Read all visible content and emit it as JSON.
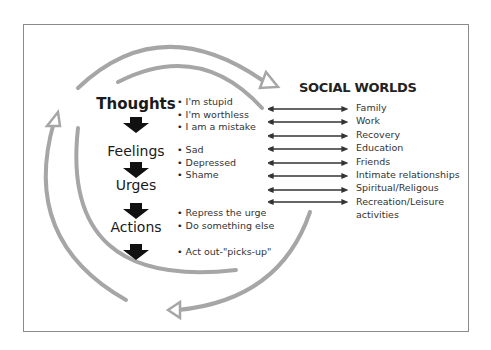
{
  "diagram": {
    "stages": [
      {
        "label": "Thoughts",
        "examples": [
          "I'm stupid",
          "I'm worthless",
          "I am a mistake"
        ]
      },
      {
        "label": "Feelings",
        "examples": [
          "Sad",
          "Depressed",
          "Shame"
        ]
      },
      {
        "label": "Urges",
        "examples": [
          "Repress the urge",
          "Do something else"
        ]
      },
      {
        "label": "Actions",
        "examples": [
          "Act out-\"picks-up\""
        ]
      }
    ],
    "social_worlds": {
      "title": "SOCIAL WORLDS",
      "items": [
        "Family",
        "Work",
        "Recovery",
        "Education",
        "Friends",
        "Intimate relationships",
        "Spiritual/Religous",
        "Recreation/Leisure",
        "activities"
      ]
    },
    "colors": {
      "arc": "#a6a6a6",
      "arrow_fill": "#111111",
      "text": "#333333",
      "border": "#8a8a8a"
    }
  }
}
